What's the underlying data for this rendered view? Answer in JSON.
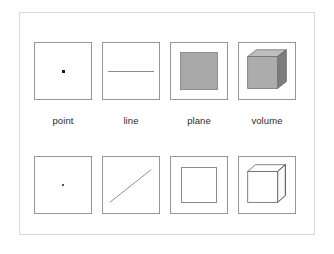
{
  "figure": {
    "background_color": "#ffffff",
    "frame_color": "#d8d8d8",
    "box_border_color": "#969696",
    "plane_fill_color": "#a8a8a8",
    "line_color": "#8c8c8c",
    "dot_color": "#1a1a1a",
    "label_color": "#2b2b2b",
    "page_marker": "."
  },
  "labels": [
    {
      "text": "point"
    },
    {
      "text": "line"
    },
    {
      "text": "plane"
    },
    {
      "text": "volume"
    }
  ],
  "top_row": [
    {
      "glyph": "point-dot",
      "description": "point"
    },
    {
      "glyph": "horizontal-line",
      "description": "line"
    },
    {
      "glyph": "filled-square",
      "description": "plane"
    },
    {
      "glyph": "shaded-cube",
      "description": "volume"
    }
  ],
  "bottom_row": [
    {
      "glyph": "point-dot-small",
      "description": "point"
    },
    {
      "glyph": "diagonal-line",
      "description": "line"
    },
    {
      "glyph": "outline-square",
      "description": "plane"
    },
    {
      "glyph": "wireframe-cube",
      "description": "volume"
    }
  ]
}
